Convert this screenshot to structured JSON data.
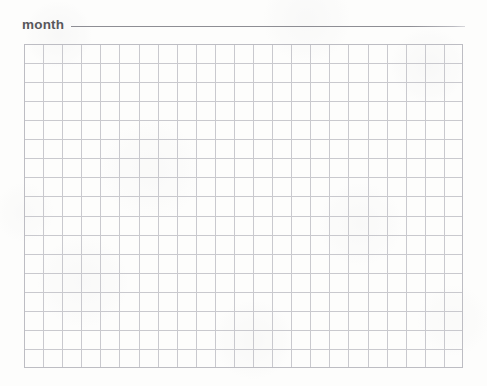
{
  "page": {
    "background_color": "#fdfdfc",
    "width": 487,
    "height": 386,
    "document_type": "blank grid worksheet"
  },
  "header": {
    "label": "month",
    "label_color": "#58585c",
    "rule": {
      "name": "fill-in-blank-rule",
      "color": "#8e8e94",
      "thickness_px": 1
    }
  },
  "grid": {
    "name": "graph-paper-grid",
    "columns": 23,
    "rows": 17,
    "cell_width_px": 19.1,
    "cell_height_px": 19.06,
    "line_color": "#c9c9ce",
    "border_color": "#bdbdc3",
    "line_thickness_px": 1,
    "origin": {
      "x": 24,
      "y": 44
    },
    "size": {
      "width": 439,
      "height": 324
    }
  }
}
